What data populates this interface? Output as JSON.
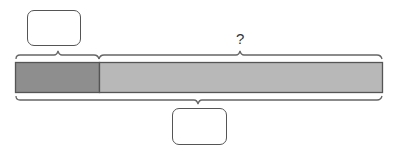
{
  "diagram": {
    "type": "tape-diagram",
    "top_label_unknown": "?",
    "top_answer_box_value": "",
    "bottom_answer_box_value": "",
    "bar": {
      "left_part_color": "#8e8e8e",
      "right_part_color": "#b8b8b8",
      "border_color": "#555555"
    }
  }
}
